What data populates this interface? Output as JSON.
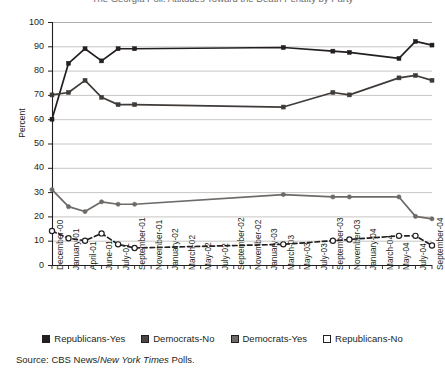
{
  "chart_data": {
    "type": "line",
    "title": "The Georgia Poll: Attitudes Toward the Death Penalty by Party",
    "xlabel": "",
    "ylabel": "Percent",
    "ylim": [
      0,
      100
    ],
    "ytick_step": 10,
    "yticks": [
      100,
      90,
      80,
      70,
      60,
      50,
      40,
      30,
      20,
      10,
      0
    ],
    "grid": "horizontal",
    "legend_position": "bottom",
    "source": "Source: CBS News/New York Times Polls.",
    "source_prefix": "Source: CBS News/",
    "source_italic": "New York Times",
    "source_suffix": " Polls.",
    "categories": [
      "December-00",
      "January-01",
      "April-01",
      "June-01",
      "July-01",
      "September-01",
      "November-01",
      "January-02",
      "March-02",
      "May-02",
      "July-02",
      "September-02",
      "November-02",
      "January-03",
      "March-03",
      "May-03",
      "July-03",
      "September-03",
      "November-03",
      "January-04",
      "March-04",
      "May-04",
      "July-04",
      "September-04"
    ],
    "series": [
      {
        "name": "Republicans-Yes",
        "color": "#231f20",
        "marker": "filled-square",
        "line": "solid",
        "values": [
          60,
          83,
          89,
          84,
          89,
          89,
          null,
          null,
          null,
          null,
          null,
          null,
          null,
          null,
          89.5,
          null,
          null,
          88,
          87.5,
          null,
          null,
          85,
          92,
          90.5
        ]
      },
      {
        "name": "Democrats-No",
        "color": "#3f3b39",
        "marker": "filled-square",
        "line": "solid",
        "values": [
          70,
          71,
          76,
          69,
          66,
          66,
          null,
          null,
          null,
          null,
          null,
          null,
          null,
          null,
          65,
          null,
          null,
          71,
          70,
          null,
          null,
          77,
          78,
          76
        ]
      },
      {
        "name": "Democrats-Yes",
        "color": "#6d6a68",
        "marker": "filled-circle",
        "line": "solid",
        "values": [
          31,
          24,
          22,
          26,
          25,
          25,
          null,
          null,
          null,
          null,
          null,
          null,
          null,
          null,
          29,
          null,
          null,
          28,
          28,
          null,
          null,
          28,
          20,
          19
        ]
      },
      {
        "name": "Republicans-No",
        "color": "#231f20",
        "marker": "open-circle",
        "line": "dashed",
        "values": [
          14,
          11,
          10,
          13,
          8.5,
          7,
          null,
          null,
          null,
          null,
          null,
          null,
          null,
          null,
          8.5,
          null,
          null,
          10,
          10.5,
          null,
          null,
          12,
          12,
          8
        ]
      }
    ]
  },
  "legend": {
    "items": [
      {
        "label": "Republicans-Yes",
        "swatch": "#231f20"
      },
      {
        "label": "Democrats-No",
        "swatch": "#4a4644"
      },
      {
        "label": "Democrats-Yes",
        "swatch": "#6d6a68"
      },
      {
        "label": "Republicans-No",
        "swatch": "#ffffff"
      }
    ]
  }
}
